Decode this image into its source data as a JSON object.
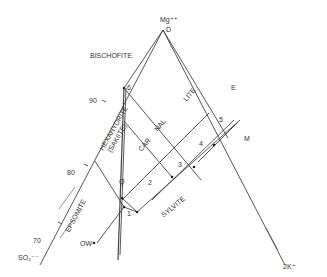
{
  "diagram": {
    "vertices": {
      "top": {
        "ion": "Mg⁺⁺",
        "point": "D"
      },
      "bottom_left": {
        "ion": "SO₄⁻⁻"
      },
      "bottom_right": {
        "ion": "2K⁺"
      }
    },
    "fields": [
      "BISCHOFITE",
      "HEXAHYDRITE (SAKIITE)",
      "CARNALLITE",
      "SYLVITE",
      "EPSOMITE"
    ],
    "carnallite_parts": [
      "CAR",
      "NAL",
      "LITE"
    ],
    "hexa_line1": "HEXAHYDRITE",
    "hexa_line2": "(SAKIITE)",
    "points": [
      "D",
      "E",
      "M",
      "Q",
      "1",
      "2",
      "3",
      "4",
      "5",
      "6",
      "OW"
    ],
    "axis_ticks": [
      "90",
      "80",
      "70"
    ]
  }
}
